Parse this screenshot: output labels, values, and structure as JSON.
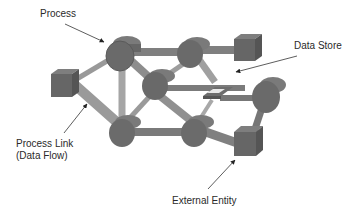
{
  "labels": {
    "process": "Process",
    "data_store": "Data Store",
    "process_link_line1": "Process Link",
    "process_link_line2": "(Data Flow)",
    "external_entity": "External Entity"
  },
  "legend_items": [
    {
      "name": "Process",
      "shape": "cylinder"
    },
    {
      "name": "Data Store",
      "shape": "flat-plate"
    },
    {
      "name": "Process Link (Data Flow)",
      "shape": "bar"
    },
    {
      "name": "External Entity",
      "shape": "cube"
    }
  ],
  "colors": {
    "node": "#6a6a6a",
    "node_dark": "#555555",
    "node_light": "#7d7d7d",
    "link": "#8c8c8c",
    "link_light": "#a4a4a4",
    "text": "#2a2a2a"
  }
}
